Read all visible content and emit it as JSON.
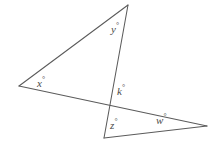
{
  "figure": {
    "background_color": "#ffffff",
    "line_color": "#5b5b5b",
    "label_color": "#4a4a4a",
    "width": 218,
    "height": 150
  },
  "points": {
    "apex": {
      "name": "top-apex",
      "x": 128,
      "y": 5
    },
    "left": {
      "name": "left-vertex",
      "x": 19,
      "y": 86
    },
    "bottom": {
      "name": "bottom-vertex",
      "x": 104,
      "y": 138
    },
    "right": {
      "name": "right-vertex",
      "x": 207,
      "y": 126
    },
    "cross": {
      "name": "crossing-point",
      "x": 110,
      "y": 104
    }
  },
  "segments": [
    {
      "name": "segment-left-to-apex",
      "from": "left",
      "to": "apex"
    },
    {
      "name": "segment-apex-to-bottom",
      "from": "apex",
      "to": "bottom"
    },
    {
      "name": "segment-left-to-right",
      "from": "left",
      "to": "right"
    },
    {
      "name": "segment-bottom-to-right",
      "from": "bottom",
      "to": "right"
    }
  ],
  "labels": [
    {
      "id": "y",
      "text": "y",
      "degree": "°",
      "x": 111,
      "y": 22,
      "vertex": "apex"
    },
    {
      "id": "x",
      "text": "x",
      "degree": "°",
      "x": 37,
      "y": 76,
      "vertex": "left"
    },
    {
      "id": "k",
      "text": "k",
      "degree": "°",
      "x": 117,
      "y": 84,
      "vertex": "cross"
    },
    {
      "id": "z",
      "text": "z",
      "degree": "°",
      "x": 110,
      "y": 118,
      "vertex": "bottom"
    },
    {
      "id": "w",
      "text": "w",
      "degree": "°",
      "x": 156,
      "y": 113,
      "vertex": "right"
    }
  ]
}
